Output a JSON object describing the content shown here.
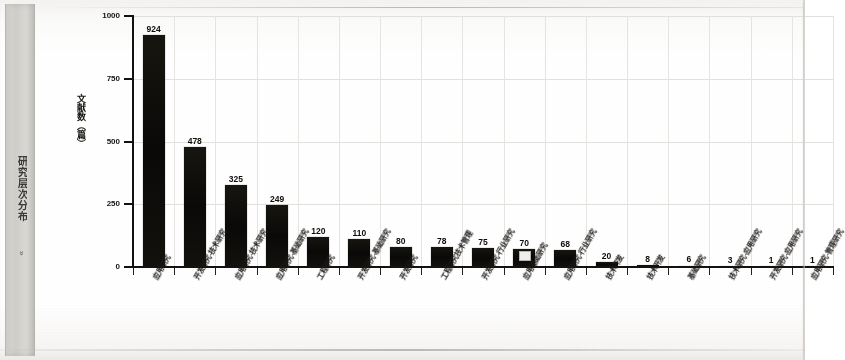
{
  "sidebar": {
    "label": "研究层次分布",
    "chevron": "»"
  },
  "chart_data": {
    "type": "bar",
    "title": "",
    "subtitle": "",
    "xlabel": "",
    "ylabel": "文献数（篇）",
    "ylim": [
      0,
      1000
    ],
    "ytick_labels": [
      "0",
      "250",
      "500",
      "750",
      "1000"
    ],
    "ytick_values": [
      0,
      250,
      500,
      750,
      1000
    ],
    "grid": true,
    "legend": null,
    "bar_color": "#100f0d",
    "categories": [
      "应用研究",
      "开发研究-技术研究",
      "应用研究-技术研究",
      "应用研究-基础研究",
      "工程研究",
      "开发研究-基础研究",
      "开发研究",
      "工程研究技术管理",
      "开发研究-行业研究",
      "应用基础研究",
      "应用研究-行业研究",
      "技术开发",
      "技术开发",
      "基础研究",
      "技术研究-应用研究",
      "开发研究-应用研究",
      "应用研究-管理研究"
    ],
    "values": [
      924,
      478,
      325,
      249,
      120,
      110,
      80,
      78,
      75,
      70,
      68,
      20,
      8,
      6,
      3,
      1,
      1
    ],
    "data_labels": [
      "924",
      "478",
      "325",
      "249",
      "120",
      "110",
      "80",
      "78",
      "75",
      "70",
      "68",
      "20",
      "8",
      "6",
      "3",
      "1",
      "1"
    ]
  }
}
